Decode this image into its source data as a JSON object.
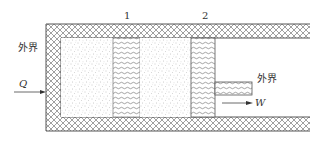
{
  "diagram": {
    "title": "",
    "labels": {
      "region_1": "1",
      "region_2": "2",
      "surroundings_left": "外界",
      "surroundings_right": "外界",
      "heat": "Q",
      "work": "W"
    },
    "components": [
      {
        "id": "insulated-wall",
        "pattern": "crosshatch"
      },
      {
        "id": "gas-region-a",
        "pattern": "stipple"
      },
      {
        "id": "partition-1",
        "pattern": "wavy-lines"
      },
      {
        "id": "gas-region-b",
        "pattern": "stipple"
      },
      {
        "id": "piston-2",
        "pattern": "wavy-lines"
      },
      {
        "id": "piston-rod",
        "pattern": "wavy-lines"
      }
    ],
    "arrows": [
      {
        "label": "Q",
        "direction": "into system (right)"
      },
      {
        "label": "W",
        "direction": "out of system (right)"
      }
    ],
    "colors": {
      "line": "#555555",
      "hatch": "#777777",
      "stipple": "#999999",
      "background": "#ffffff"
    }
  }
}
